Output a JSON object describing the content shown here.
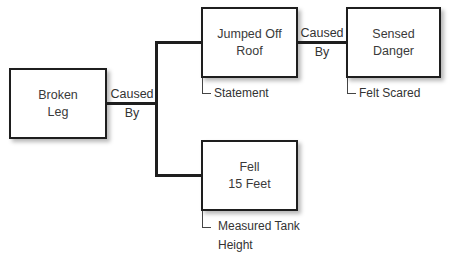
{
  "nodes": {
    "broken_leg": {
      "line1": "Broken",
      "line2": "Leg"
    },
    "jumped_off_roof": {
      "line1": "Jumped Off",
      "line2": "Roof",
      "evidence": "Statement"
    },
    "sensed_danger": {
      "line1": "Sensed",
      "line2": "Danger",
      "evidence": "Felt Scared"
    },
    "fell_15_feet": {
      "line1": "Fell",
      "line2": "15 Feet",
      "evidence_line1": "Measured Tank",
      "evidence_line2": "Height"
    }
  },
  "edges": {
    "leg_to_causes": {
      "line1": "Caused",
      "line2": "By"
    },
    "roof_to_danger": {
      "line1": "Caused",
      "line2": "By"
    }
  }
}
